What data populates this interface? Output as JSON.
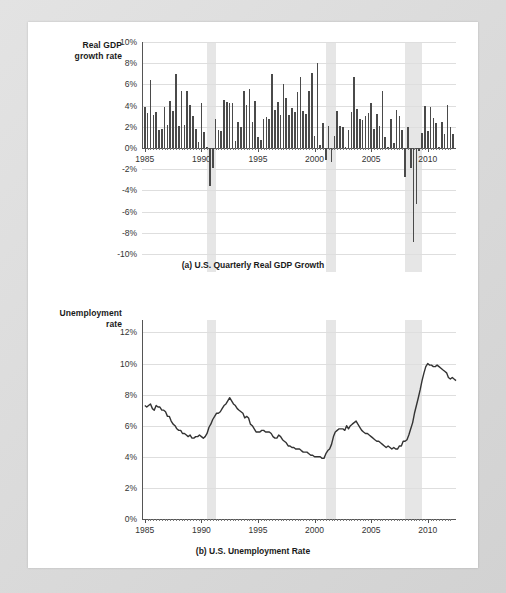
{
  "figure": {
    "panels": [
      {
        "id": "gdp",
        "axis_title_line1": "Real GDP",
        "axis_title_line2": "growth rate",
        "caption": "(a) U.S. Quarterly Real GDP Growth"
      },
      {
        "id": "unemployment",
        "axis_title_line1": "Unemployment",
        "axis_title_line2": "rate",
        "caption": "(b) U.S. Unemployment Rate"
      }
    ],
    "colors": {
      "bar": "#4a4a4a",
      "line": "#333333",
      "recession_band": "#e6e6e6",
      "gridline": "#dedede",
      "axis": "#555555",
      "page_background": "#ffffff",
      "frame_background": "#dcdcdc"
    }
  },
  "chart_data": [
    {
      "type": "bar",
      "id": "gdp",
      "title": "(a) U.S. Quarterly Real GDP Growth",
      "xlabel": "",
      "ylabel": "Real GDP growth rate",
      "xlim": [
        1984.75,
        2012.5
      ],
      "ylim": [
        -10,
        10
      ],
      "grid": true,
      "legend": "none",
      "ytick_labels": [
        "10%",
        "8%",
        "6%",
        "4%",
        "2%",
        "0%",
        "-2%",
        "-4%",
        "-6%",
        "-8%",
        "-10%"
      ],
      "ytick_values": [
        10,
        8,
        6,
        4,
        2,
        0,
        -2,
        -4,
        -6,
        -8,
        -10
      ],
      "xtick_labels": [
        "1985",
        "1990",
        "1995",
        "2000",
        "2005",
        "2010"
      ],
      "xtick_values": [
        1985,
        1990,
        1995,
        2000,
        2005,
        2010
      ],
      "recession_bands": [
        {
          "start": 1990.5,
          "end": 1991.25
        },
        {
          "start": 2001.0,
          "end": 2001.9
        },
        {
          "start": 2007.95,
          "end": 2009.5
        }
      ],
      "x": [
        1985.0,
        1985.25,
        1985.5,
        1985.75,
        1986.0,
        1986.25,
        1986.5,
        1986.75,
        1987.0,
        1987.25,
        1987.5,
        1987.75,
        1988.0,
        1988.25,
        1988.5,
        1988.75,
        1989.0,
        1989.25,
        1989.5,
        1989.75,
        1990.0,
        1990.25,
        1990.5,
        1990.75,
        1991.0,
        1991.25,
        1991.5,
        1991.75,
        1992.0,
        1992.25,
        1992.5,
        1992.75,
        1993.0,
        1993.25,
        1993.5,
        1993.75,
        1994.0,
        1994.25,
        1994.5,
        1994.75,
        1995.0,
        1995.25,
        1995.5,
        1995.75,
        1996.0,
        1996.25,
        1996.5,
        1996.75,
        1997.0,
        1997.25,
        1997.5,
        1997.75,
        1998.0,
        1998.25,
        1998.5,
        1998.75,
        1999.0,
        1999.25,
        1999.5,
        1999.75,
        2000.0,
        2000.25,
        2000.5,
        2000.75,
        2001.0,
        2001.25,
        2001.5,
        2001.75,
        2002.0,
        2002.25,
        2002.5,
        2002.75,
        2003.0,
        2003.25,
        2003.5,
        2003.75,
        2004.0,
        2004.25,
        2004.5,
        2004.75,
        2005.0,
        2005.25,
        2005.5,
        2005.75,
        2006.0,
        2006.25,
        2006.5,
        2006.75,
        2007.0,
        2007.25,
        2007.5,
        2007.75,
        2008.0,
        2008.25,
        2008.5,
        2008.75,
        2009.0,
        2009.25,
        2009.5,
        2009.75,
        2010.0,
        2010.25,
        2010.5,
        2010.75,
        2011.0,
        2011.25,
        2011.5,
        2011.75,
        2012.0,
        2012.25
      ],
      "values": [
        3.9,
        3.3,
        6.4,
        3.1,
        3.4,
        1.7,
        1.8,
        3.9,
        2.2,
        4.4,
        3.5,
        7.0,
        2.1,
        5.4,
        2.2,
        5.4,
        4.1,
        3.0,
        1.8,
        0.6,
        4.2,
        1.5,
        0.1,
        -3.6,
        -1.9,
        2.7,
        1.7,
        1.6,
        4.5,
        4.3,
        4.2,
        4.2,
        0.7,
        2.5,
        2.0,
        5.4,
        4.1,
        5.6,
        2.5,
        4.4,
        1.0,
        0.8,
        2.7,
        2.9,
        2.7,
        7.0,
        3.6,
        4.3,
        3.1,
        6.0,
        4.7,
        3.1,
        3.8,
        3.4,
        5.3,
        6.7,
        3.5,
        3.2,
        5.4,
        7.1,
        1.1,
        8.0,
        0.3,
        2.4,
        -1.1,
        2.1,
        -1.3,
        1.1,
        3.5,
        2.1,
        2.0,
        0.1,
        1.7,
        3.4,
        6.7,
        3.7,
        2.7,
        2.6,
        3.0,
        3.3,
        4.2,
        1.8,
        3.2,
        2.1,
        5.4,
        1.0,
        0.1,
        2.7,
        0.5,
        3.6,
        3.0,
        1.7,
        -2.7,
        2.0,
        -1.9,
        -8.9,
        -5.3,
        -0.3,
        1.4,
        4.0,
        1.6,
        3.9,
        2.8,
        2.4,
        0.1,
        2.5,
        1.3,
        4.1,
        2.0,
        1.3
      ]
    },
    {
      "type": "line",
      "id": "unemployment",
      "title": "(b) U.S. Unemployment Rate",
      "xlabel": "",
      "ylabel": "Unemployment rate",
      "xlim": [
        1984.75,
        2012.5
      ],
      "ylim": [
        0,
        12.8
      ],
      "grid": true,
      "legend": "none",
      "ytick_labels": [
        "12%",
        "10%",
        "8%",
        "6%",
        "4%",
        "2%",
        "0%"
      ],
      "ytick_values": [
        12,
        10,
        8,
        6,
        4,
        2,
        0
      ],
      "xtick_labels": [
        "1985",
        "1990",
        "1995",
        "2000",
        "2005",
        "2010"
      ],
      "xtick_values": [
        1985,
        1990,
        1995,
        2000,
        2005,
        2010
      ],
      "recession_bands": [
        {
          "start": 1990.5,
          "end": 1991.25
        },
        {
          "start": 2001.0,
          "end": 2001.9
        },
        {
          "start": 2007.95,
          "end": 2009.5
        }
      ],
      "series": [
        {
          "name": "U.S. unemployment rate",
          "x": [
            1985.0,
            1985.17,
            1985.33,
            1985.5,
            1985.67,
            1985.83,
            1986.0,
            1986.17,
            1986.33,
            1986.5,
            1986.67,
            1986.83,
            1987.0,
            1987.17,
            1987.33,
            1987.5,
            1987.67,
            1987.83,
            1988.0,
            1988.17,
            1988.33,
            1988.5,
            1988.67,
            1988.83,
            1989.0,
            1989.17,
            1989.33,
            1989.5,
            1989.67,
            1989.83,
            1990.0,
            1990.17,
            1990.33,
            1990.5,
            1990.67,
            1990.83,
            1991.0,
            1991.17,
            1991.33,
            1991.5,
            1991.67,
            1991.83,
            1992.0,
            1992.17,
            1992.33,
            1992.5,
            1992.67,
            1992.83,
            1993.0,
            1993.17,
            1993.33,
            1993.5,
            1993.67,
            1993.83,
            1994.0,
            1994.17,
            1994.33,
            1994.5,
            1994.67,
            1994.83,
            1995.0,
            1995.17,
            1995.33,
            1995.5,
            1995.67,
            1995.83,
            1996.0,
            1996.17,
            1996.33,
            1996.5,
            1996.67,
            1996.83,
            1997.0,
            1997.17,
            1997.33,
            1997.5,
            1997.67,
            1997.83,
            1998.0,
            1998.17,
            1998.33,
            1998.5,
            1998.67,
            1998.83,
            1999.0,
            1999.17,
            1999.33,
            1999.5,
            1999.67,
            1999.83,
            2000.0,
            2000.17,
            2000.33,
            2000.5,
            2000.67,
            2000.83,
            2001.0,
            2001.17,
            2001.33,
            2001.5,
            2001.67,
            2001.83,
            2002.0,
            2002.17,
            2002.33,
            2002.5,
            2002.67,
            2002.83,
            2003.0,
            2003.17,
            2003.33,
            2003.5,
            2003.67,
            2003.83,
            2004.0,
            2004.17,
            2004.33,
            2004.5,
            2004.67,
            2004.83,
            2005.0,
            2005.17,
            2005.33,
            2005.5,
            2005.67,
            2005.83,
            2006.0,
            2006.17,
            2006.33,
            2006.5,
            2006.67,
            2006.83,
            2007.0,
            2007.17,
            2007.33,
            2007.5,
            2007.67,
            2007.83,
            2008.0,
            2008.17,
            2008.33,
            2008.5,
            2008.67,
            2008.83,
            2009.0,
            2009.17,
            2009.33,
            2009.5,
            2009.67,
            2009.83,
            2010.0,
            2010.17,
            2010.33,
            2010.5,
            2010.67,
            2010.83,
            2011.0,
            2011.17,
            2011.33,
            2011.5,
            2011.67,
            2011.83,
            2012.0,
            2012.17,
            2012.33,
            2012.5
          ],
          "values": [
            7.3,
            7.2,
            7.3,
            7.4,
            7.1,
            7.0,
            7.3,
            7.2,
            7.2,
            7.0,
            7.0,
            6.9,
            6.6,
            6.6,
            6.3,
            6.1,
            6.0,
            5.8,
            5.7,
            5.7,
            5.5,
            5.5,
            5.4,
            5.3,
            5.4,
            5.2,
            5.2,
            5.3,
            5.3,
            5.4,
            5.3,
            5.2,
            5.3,
            5.5,
            5.9,
            6.1,
            6.4,
            6.6,
            6.8,
            6.8,
            6.9,
            7.1,
            7.3,
            7.4,
            7.6,
            7.8,
            7.6,
            7.4,
            7.3,
            7.1,
            7.0,
            6.9,
            6.8,
            6.5,
            6.6,
            6.5,
            6.1,
            6.0,
            5.8,
            5.6,
            5.6,
            5.6,
            5.7,
            5.7,
            5.6,
            5.6,
            5.6,
            5.5,
            5.3,
            5.2,
            5.2,
            5.4,
            5.3,
            5.1,
            5.0,
            4.9,
            4.7,
            4.7,
            4.6,
            4.6,
            4.5,
            4.5,
            4.5,
            4.4,
            4.3,
            4.3,
            4.3,
            4.2,
            4.1,
            4.1,
            4.0,
            4.0,
            4.0,
            4.0,
            3.9,
            3.9,
            4.2,
            4.4,
            4.5,
            4.8,
            5.3,
            5.6,
            5.7,
            5.8,
            5.8,
            5.8,
            5.7,
            6.0,
            5.8,
            6.0,
            6.1,
            6.2,
            6.3,
            6.1,
            5.9,
            5.7,
            5.6,
            5.5,
            5.5,
            5.4,
            5.3,
            5.2,
            5.1,
            5.0,
            5.0,
            4.9,
            4.8,
            4.7,
            4.6,
            4.7,
            4.6,
            4.5,
            4.6,
            4.5,
            4.5,
            4.7,
            4.7,
            5.0,
            5.0,
            5.1,
            5.4,
            5.8,
            6.2,
            6.8,
            7.3,
            7.8,
            8.3,
            8.9,
            9.4,
            9.8,
            10.0,
            9.9,
            9.9,
            9.8,
            9.8,
            9.9,
            9.8,
            9.7,
            9.6,
            9.5,
            9.4,
            9.1,
            9.0,
            9.1,
            9.0,
            8.9,
            8.7,
            8.5,
            8.3,
            8.2,
            8.2,
            8.1
          ]
        }
      ]
    }
  ]
}
